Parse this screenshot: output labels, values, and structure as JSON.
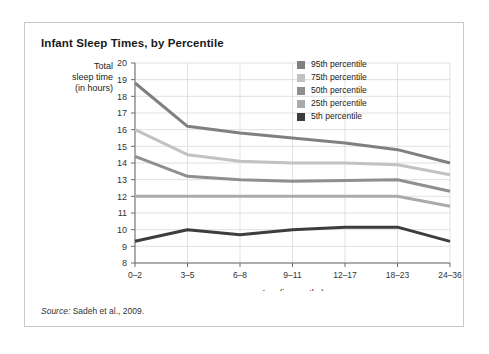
{
  "card": {
    "title": "Infant Sleep Times, by Percentile",
    "source_label": "Source:",
    "source_text": " Sadeh et al., 2009."
  },
  "chart_data": {
    "type": "line",
    "title": "Infant Sleep Times, by Percentile",
    "xlabel": "Age (in months)",
    "ylabel": "Total sleep time (in hours)",
    "ylabel_lines": [
      "Total",
      "sleep time",
      "(in hours)"
    ],
    "categories": [
      "0–2",
      "3–5",
      "6–8",
      "9–11",
      "12–17",
      "18–23",
      "24–36"
    ],
    "ylim": [
      8,
      20
    ],
    "yticks": [
      8,
      9,
      10,
      11,
      12,
      13,
      14,
      15,
      16,
      17,
      18,
      19,
      20
    ],
    "grid": true,
    "legend_position": "inside-top-right",
    "series": [
      {
        "name": "95th percentile",
        "color": "#808080",
        "values": [
          18.8,
          16.2,
          15.8,
          15.5,
          15.2,
          14.8,
          14.0
        ]
      },
      {
        "name": "75th percentile",
        "color": "#c2c2c2",
        "values": [
          16.0,
          14.5,
          14.1,
          14.0,
          14.0,
          13.9,
          13.3
        ]
      },
      {
        "name": "50th percentile",
        "color": "#8f8f8f",
        "values": [
          14.4,
          13.2,
          13.0,
          12.9,
          12.95,
          13.0,
          12.3
        ]
      },
      {
        "name": "25th percentile",
        "color": "#aaaaaa",
        "values": [
          12.0,
          12.0,
          12.0,
          12.0,
          12.0,
          12.0,
          11.4
        ]
      },
      {
        "name": "5th percentile",
        "color": "#3d3d3d",
        "values": [
          9.3,
          10.0,
          9.7,
          10.0,
          10.15,
          10.15,
          9.3
        ]
      }
    ]
  }
}
